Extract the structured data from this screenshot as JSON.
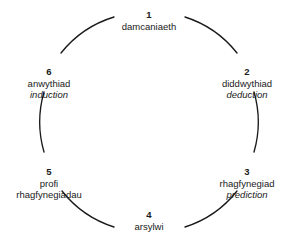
{
  "diagram": {
    "type": "cycle",
    "direction": "clockwise",
    "node_count": 6,
    "line_color": "#1a1a1a",
    "text_color": "#1a1a1a",
    "background_color": "#ffffff",
    "nodes": [
      {
        "number": "1",
        "term": "damcaniaeth",
        "term2": "",
        "gloss": "",
        "position": "top"
      },
      {
        "number": "2",
        "term": "diddwythiad",
        "term2": "",
        "gloss": "deduction",
        "position": "upper-right"
      },
      {
        "number": "3",
        "term": "rhagfynegiad",
        "term2": "",
        "gloss": "prediction",
        "position": "lower-right"
      },
      {
        "number": "4",
        "term": "arsylwi",
        "term2": "",
        "gloss": "",
        "position": "bottom"
      },
      {
        "number": "5",
        "term": "profi",
        "term2": "rhagfynegiadau",
        "gloss": "",
        "position": "lower-left"
      },
      {
        "number": "6",
        "term": "anwythiad",
        "term2": "",
        "gloss": "induction",
        "position": "upper-left"
      }
    ],
    "connectors": [
      {
        "name": "arc-6-to-1",
        "from": "6",
        "to": "1"
      },
      {
        "name": "arc-1-to-2",
        "from": "1",
        "to": "2"
      },
      {
        "name": "arc-2-to-3",
        "from": "2",
        "to": "3"
      },
      {
        "name": "arc-3-to-4",
        "from": "3",
        "to": "4"
      },
      {
        "name": "arc-4-to-5",
        "from": "4",
        "to": "5"
      },
      {
        "name": "arc-5-to-6",
        "from": "5",
        "to": "6"
      }
    ]
  }
}
